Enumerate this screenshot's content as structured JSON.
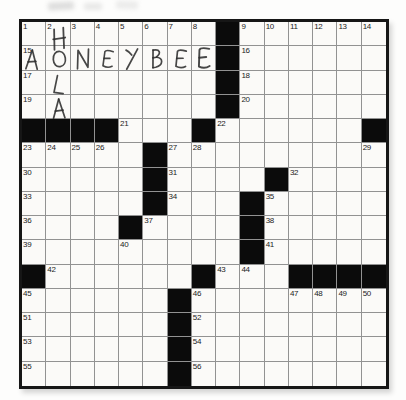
{
  "puzzle": {
    "type": "crossword",
    "rows": 15,
    "cols": 15,
    "black_cells_rc": [
      [
        1,
        9
      ],
      [
        2,
        9
      ],
      [
        3,
        9
      ],
      [
        4,
        9
      ],
      [
        5,
        1
      ],
      [
        5,
        2
      ],
      [
        5,
        3
      ],
      [
        5,
        4
      ],
      [
        5,
        8
      ],
      [
        5,
        15
      ],
      [
        6,
        6
      ],
      [
        7,
        6
      ],
      [
        7,
        11
      ],
      [
        8,
        6
      ],
      [
        8,
        10
      ],
      [
        9,
        5
      ],
      [
        9,
        10
      ],
      [
        10,
        10
      ],
      [
        11,
        1
      ],
      [
        11,
        8
      ],
      [
        11,
        12
      ],
      [
        11,
        13
      ],
      [
        11,
        14
      ],
      [
        11,
        15
      ],
      [
        12,
        7
      ],
      [
        13,
        7
      ],
      [
        14,
        7
      ],
      [
        15,
        7
      ]
    ],
    "numbers_rcn": [
      [
        1,
        1,
        "1"
      ],
      [
        1,
        2,
        "2"
      ],
      [
        1,
        3,
        "3"
      ],
      [
        1,
        4,
        "4"
      ],
      [
        1,
        5,
        "5"
      ],
      [
        1,
        6,
        "6"
      ],
      [
        1,
        7,
        "7"
      ],
      [
        1,
        8,
        "8"
      ],
      [
        1,
        10,
        "9"
      ],
      [
        1,
        11,
        "10"
      ],
      [
        1,
        12,
        "11"
      ],
      [
        1,
        13,
        "12"
      ],
      [
        1,
        14,
        "13"
      ],
      [
        1,
        15,
        "14"
      ],
      [
        2,
        1,
        "15"
      ],
      [
        2,
        10,
        "16"
      ],
      [
        3,
        1,
        "17"
      ],
      [
        3,
        10,
        "18"
      ],
      [
        4,
        1,
        "19"
      ],
      [
        4,
        10,
        "20"
      ],
      [
        5,
        5,
        "21"
      ],
      [
        5,
        9,
        "22"
      ],
      [
        6,
        1,
        "23"
      ],
      [
        6,
        2,
        "24"
      ],
      [
        6,
        3,
        "25"
      ],
      [
        6,
        4,
        "26"
      ],
      [
        6,
        7,
        "27"
      ],
      [
        6,
        8,
        "28"
      ],
      [
        6,
        15,
        "29"
      ],
      [
        7,
        1,
        "30"
      ],
      [
        7,
        7,
        "31"
      ],
      [
        7,
        12,
        "32"
      ],
      [
        8,
        1,
        "33"
      ],
      [
        8,
        7,
        "34"
      ],
      [
        8,
        11,
        "35"
      ],
      [
        9,
        1,
        "36"
      ],
      [
        9,
        6,
        "37"
      ],
      [
        9,
        11,
        "38"
      ],
      [
        10,
        1,
        "39"
      ],
      [
        10,
        5,
        "40"
      ],
      [
        10,
        11,
        "41"
      ],
      [
        11,
        2,
        "42"
      ],
      [
        11,
        9,
        "43"
      ],
      [
        11,
        10,
        "44"
      ],
      [
        12,
        1,
        "45"
      ],
      [
        12,
        8,
        "46"
      ],
      [
        12,
        12,
        "47"
      ],
      [
        12,
        13,
        "48"
      ],
      [
        12,
        14,
        "49"
      ],
      [
        12,
        15,
        "50"
      ],
      [
        13,
        1,
        "51"
      ],
      [
        13,
        8,
        "52"
      ],
      [
        14,
        1,
        "53"
      ],
      [
        14,
        8,
        "54"
      ],
      [
        15,
        1,
        "55"
      ],
      [
        15,
        8,
        "56"
      ]
    ],
    "handwritten_letters": [
      {
        "r": 1,
        "c": 2,
        "ch": "H",
        "rot": -4,
        "dx": 2,
        "dy": 5,
        "s": 1.05
      },
      {
        "r": 2,
        "c": 1,
        "ch": "A",
        "rot": 2,
        "dx": -1,
        "dy": 1,
        "s": 1
      },
      {
        "r": 2,
        "c": 2,
        "ch": "O",
        "rot": 0,
        "dx": 2,
        "dy": 1,
        "s": 1
      },
      {
        "r": 2,
        "c": 3,
        "ch": "N",
        "rot": -3,
        "dx": 1,
        "dy": 1,
        "s": 1
      },
      {
        "r": 2,
        "c": 4,
        "ch": "E",
        "rot": 4,
        "dx": 2,
        "dy": 1,
        "s": 0.95
      },
      {
        "r": 2,
        "c": 5,
        "ch": "Y",
        "rot": 4,
        "dx": 1,
        "dy": 0,
        "s": 1
      },
      {
        "r": 2,
        "c": 6,
        "ch": "B",
        "rot": -3,
        "dx": 3,
        "dy": 1,
        "s": 1
      },
      {
        "r": 2,
        "c": 7,
        "ch": "E",
        "rot": 2,
        "dx": 2,
        "dy": 1,
        "s": 1
      },
      {
        "r": 2,
        "c": 8,
        "ch": "E",
        "rot": -2,
        "dx": 1,
        "dy": 0,
        "s": 1.12
      },
      {
        "r": 3,
        "c": 2,
        "ch": "L",
        "rot": 6,
        "dx": 3,
        "dy": 2,
        "s": 1
      },
      {
        "r": 4,
        "c": 2,
        "ch": "A",
        "rot": -2,
        "dx": 2,
        "dy": 1,
        "s": 1
      }
    ],
    "handwritten_words": {
      "down_col2": "HOLA",
      "across_row2": "AONEYBEE"
    }
  },
  "colors": {
    "paper": "#fbfaf8",
    "grid_line": "#929292",
    "black_cell": "#0b0b0b",
    "outer_border": "#161616",
    "clue_number": "#1c1c1c",
    "pencil": "#2e2e2e"
  }
}
